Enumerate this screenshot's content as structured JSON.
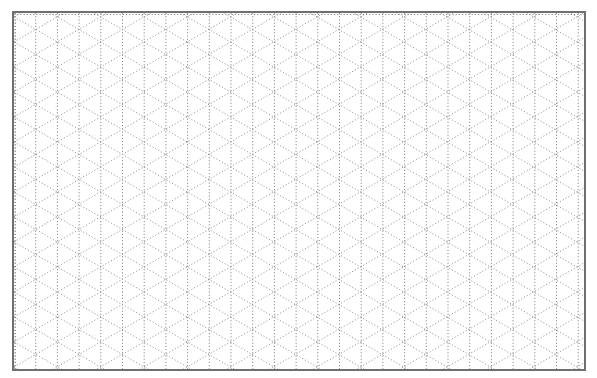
{
  "grid": {
    "type": "isometric",
    "column_spacing_px": 21.7,
    "row_period_px": 25,
    "line_style": "dotted",
    "line_color": "#9a9a9a",
    "vertical_line_color": "#8a8a8a",
    "frame_color": "#6f6f6f",
    "background_color": "#ffffff"
  }
}
